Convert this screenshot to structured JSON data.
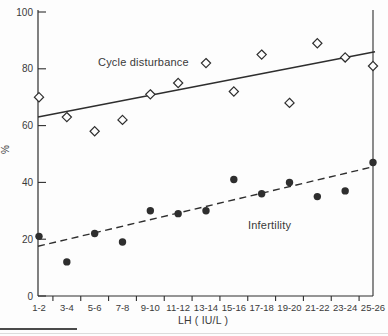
{
  "chart_data": {
    "type": "scatter",
    "title": "",
    "xlabel": "LH ( IU/L )",
    "ylabel": "%",
    "ylim": [
      0,
      100
    ],
    "y_ticks": [
      0,
      20,
      40,
      60,
      80,
      100
    ],
    "categories": [
      "1-2",
      "3-4",
      "5-6",
      "7-8",
      "9-10",
      "11-12",
      "13-14",
      "15-16",
      "17-18",
      "19-20",
      "21-22",
      "23-24",
      "25-26"
    ],
    "grid": "off",
    "legend_position": "inline-annotations",
    "series": [
      {
        "name": "Cycle disturbance",
        "marker": "open-diamond",
        "trend_line_style": "solid",
        "values": [
          70,
          63,
          58,
          62,
          71,
          75,
          82,
          72,
          85,
          68,
          89,
          84,
          81
        ],
        "trend_line": {
          "start_value": 63,
          "end_value": 86
        }
      },
      {
        "name": "Infertility",
        "marker": "filled-circle",
        "trend_line_style": "dashed",
        "values": [
          21,
          12,
          22,
          19,
          30,
          29,
          30,
          41,
          36,
          40,
          35,
          37,
          47
        ],
        "trend_line": {
          "start_value": 17.5,
          "end_value": 45.5
        }
      }
    ]
  },
  "annotations": {
    "series1_label": "Cycle disturbance",
    "series2_label": "Infertility"
  },
  "axis": {
    "xlabel": "LH ( IU/L )",
    "ylabel": "%"
  },
  "colors": {
    "ink": "#2e2e2e",
    "text": "#3a3a3a",
    "background": "#fdfdfd",
    "caption_rule": "#4a4a4a",
    "caption_rule_faint": "#dcdcdc"
  }
}
